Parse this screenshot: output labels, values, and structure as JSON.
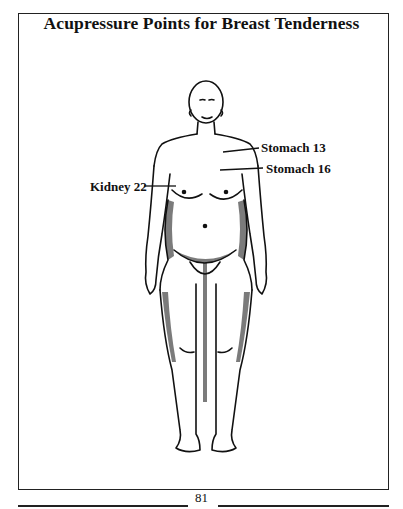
{
  "page": {
    "title": "Acupressure Points for Breast Tenderness",
    "page_number": "81"
  },
  "figure": {
    "points": [
      {
        "label": "Stomach 13",
        "side": "right"
      },
      {
        "label": "Stomach 16",
        "side": "right"
      },
      {
        "label": "Kidney 22",
        "side": "left"
      }
    ]
  }
}
